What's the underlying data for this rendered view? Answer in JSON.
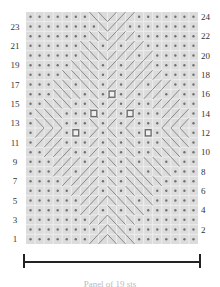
{
  "chart": {
    "columns": 19,
    "rows": 24,
    "colors": {
      "background": "#dcdcdc",
      "grid_line": "#f4f4f4",
      "purl_dot": "#6f6f6f",
      "cable_line": "#7a7a7a",
      "bobble": "#6a6a6a"
    },
    "row_labels_left": [
      "23",
      "21",
      "19",
      "17",
      "15",
      "13",
      "11",
      "9",
      "7",
      "5",
      "3",
      "1"
    ],
    "row_labels_right": [
      "24",
      "22",
      "20",
      "18",
      "16",
      "14",
      "12",
      "10",
      "8",
      "6",
      "4",
      "2"
    ],
    "legend": {
      "purl": "dot",
      "knit": "blank",
      "cable": "diagonal lines",
      "bobble": "square"
    },
    "repeat_bracket": "full width",
    "caption": "Panel of 19 sts"
  }
}
